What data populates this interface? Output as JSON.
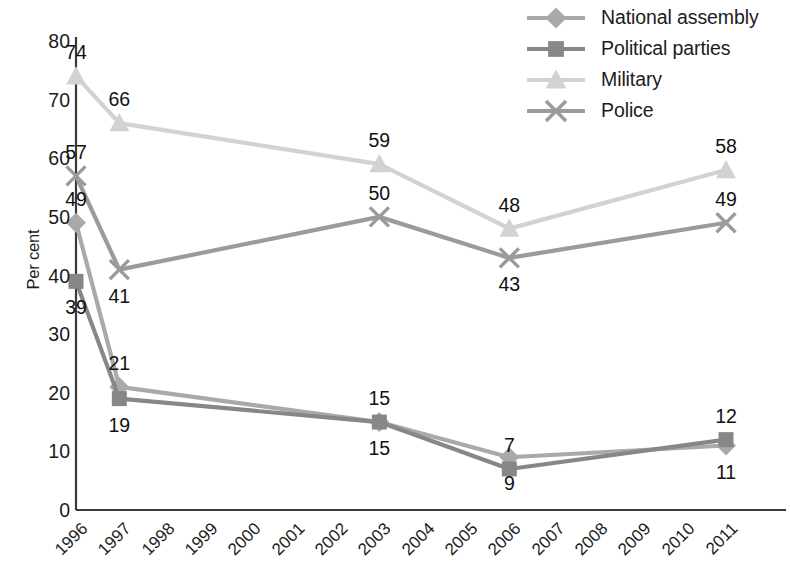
{
  "chart_data": {
    "type": "line",
    "title": "",
    "xlabel": "",
    "ylabel": "Per cent",
    "ylim": [
      0,
      80
    ],
    "ytick_values": [
      0,
      10,
      20,
      30,
      40,
      50,
      60,
      70,
      80
    ],
    "ytick_labels": [
      "0",
      "10",
      "20",
      "30",
      "40",
      "50",
      "60",
      "70",
      "80"
    ],
    "grid": false,
    "legend_position": "top-right",
    "categories": [
      "1996",
      "1997",
      "1998",
      "1999",
      "2000",
      "2001",
      "2002",
      "2003",
      "2004",
      "2005",
      "2006",
      "2007",
      "2008",
      "2009",
      "2010",
      "2011"
    ],
    "data_years": [
      "1996",
      "1997",
      "2003",
      "2006",
      "2011"
    ],
    "series": [
      {
        "name": "National assembly",
        "marker": "diamond",
        "color": "#a9a9a9",
        "x": [
          "1996",
          "1997",
          "2003",
          "2006",
          "2011"
        ],
        "values": [
          49,
          21,
          15,
          9,
          11
        ],
        "labels": [
          "49",
          "21",
          "15",
          "9",
          "11"
        ],
        "label_positions": [
          "above",
          "above",
          "below",
          "below",
          "below"
        ]
      },
      {
        "name": "Political parties",
        "marker": "square",
        "color": "#878787",
        "x": [
          "1996",
          "1997",
          "2003",
          "2006",
          "2011"
        ],
        "values": [
          39,
          19,
          15,
          7,
          12
        ],
        "labels": [
          "39",
          "19",
          "15",
          "7",
          "12"
        ],
        "label_positions": [
          "below",
          "below",
          "above",
          "above",
          "above"
        ]
      },
      {
        "name": "Military",
        "marker": "triangle",
        "color": "#d2d2d2",
        "x": [
          "1996",
          "1997",
          "2003",
          "2006",
          "2011"
        ],
        "values": [
          74,
          66,
          59,
          48,
          58
        ],
        "labels": [
          "74",
          "66",
          "59",
          "48",
          "58"
        ],
        "label_positions": [
          "above",
          "above",
          "above",
          "above",
          "above"
        ]
      },
      {
        "name": "Police",
        "marker": "cross",
        "color": "#9b9b9b",
        "x": [
          "1996",
          "1997",
          "2003",
          "2006",
          "2011"
        ],
        "values": [
          57,
          41,
          50,
          43,
          49
        ],
        "labels": [
          "57",
          "41",
          "50",
          "43",
          "49"
        ],
        "label_positions": [
          "above",
          "below",
          "above",
          "below",
          "above"
        ]
      }
    ]
  },
  "legend": {
    "items": [
      {
        "label": "National assembly",
        "marker": "diamond",
        "color": "#a9a9a9"
      },
      {
        "label": "Political parties",
        "marker": "square",
        "color": "#878787"
      },
      {
        "label": "Military",
        "marker": "triangle",
        "color": "#d2d2d2"
      },
      {
        "label": "Police",
        "marker": "cross",
        "color": "#9b9b9b"
      }
    ]
  },
  "axes": {
    "y_title": "Per cent",
    "axis_color": "#3a3a3a"
  }
}
